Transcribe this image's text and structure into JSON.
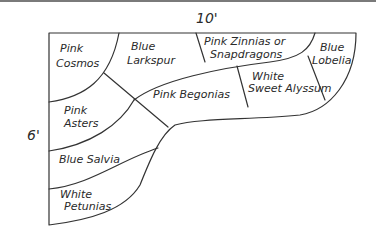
{
  "diagram": {
    "type": "garden-bed-planting-plan",
    "dimensions": {
      "width_label": "10'",
      "height_label": "6'"
    },
    "beds": [
      {
        "id": "pink-cosmos",
        "lines": [
          "Pink",
          "Cosmos"
        ]
      },
      {
        "id": "blue-larkspur",
        "lines": [
          "Blue",
          "Larkspur"
        ]
      },
      {
        "id": "pink-zinnias-or-snapdragons",
        "lines": [
          "Pink Zinnias or",
          "Snapdragons"
        ]
      },
      {
        "id": "blue-lobelia",
        "lines": [
          "Blue",
          "Lobelia"
        ]
      },
      {
        "id": "white-sweet-alyssum",
        "lines": [
          "White",
          "Sweet Alyssum"
        ]
      },
      {
        "id": "pink-begonias",
        "lines": [
          "Pink Begonias"
        ]
      },
      {
        "id": "pink-asters",
        "lines": [
          "Pink",
          "Asters"
        ]
      },
      {
        "id": "blue-salvia",
        "lines": [
          "Blue Salvia"
        ]
      },
      {
        "id": "white-petunias",
        "lines": [
          "White",
          "Petunias"
        ]
      }
    ],
    "colors": {
      "ink": "#333333",
      "background": "#ffffff",
      "top_rule": "#7a7a7a"
    }
  }
}
